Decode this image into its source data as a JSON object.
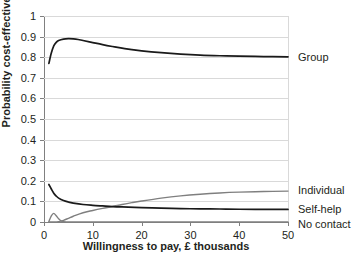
{
  "chart_data": {
    "type": "line",
    "title": "",
    "xlabel": "Willingness to pay, £ thousands",
    "ylabel": "Probability cost-effective",
    "xlim": [
      0,
      50
    ],
    "ylim": [
      0,
      1
    ],
    "xticks": [
      "0",
      "10",
      "20",
      "30",
      "40",
      "50"
    ],
    "yticks": [
      "0",
      "0.1",
      "0.2",
      "0.3",
      "0.4",
      "0.5",
      "0.6",
      "0.7",
      "0.8",
      "0.9",
      "1"
    ],
    "grid": "horizontal",
    "legend_position": "right-of-plot-at-series-end",
    "series": [
      {
        "name": "Group",
        "color": "#1a1a1a",
        "x": [
          1,
          1.5,
          2,
          2.5,
          3,
          4,
          5,
          6,
          7,
          8,
          10,
          12,
          14,
          16,
          18,
          20,
          24,
          28,
          32,
          36,
          40,
          45,
          50
        ],
        "values": [
          0.77,
          0.82,
          0.855,
          0.872,
          0.881,
          0.888,
          0.89,
          0.889,
          0.886,
          0.881,
          0.871,
          0.861,
          0.852,
          0.844,
          0.837,
          0.831,
          0.822,
          0.815,
          0.81,
          0.807,
          0.805,
          0.803,
          0.802
        ]
      },
      {
        "name": "Individual",
        "color": "#7f7f7f",
        "x": [
          1,
          2,
          3,
          4,
          5,
          6,
          8,
          10,
          12,
          14,
          16,
          18,
          20,
          24,
          28,
          32,
          36,
          40,
          45,
          50
        ],
        "values": [
          0.0,
          0.0,
          0.002,
          0.008,
          0.018,
          0.028,
          0.045,
          0.056,
          0.066,
          0.075,
          0.085,
          0.094,
          0.102,
          0.116,
          0.127,
          0.135,
          0.141,
          0.145,
          0.148,
          0.15
        ]
      },
      {
        "name": "Self-help",
        "color": "#1a1a1a",
        "x": [
          1,
          1.5,
          2,
          2.5,
          3,
          4,
          5,
          6,
          8,
          10,
          12,
          14,
          16,
          20,
          24,
          28,
          32,
          36,
          40,
          45,
          50
        ],
        "values": [
          0.182,
          0.16,
          0.14,
          0.126,
          0.116,
          0.104,
          0.097,
          0.092,
          0.085,
          0.081,
          0.078,
          0.075,
          0.073,
          0.07,
          0.067,
          0.065,
          0.064,
          0.063,
          0.062,
          0.061,
          0.061
        ]
      },
      {
        "name": "No contact",
        "color": "#7f7f7f",
        "x": [
          1,
          1.5,
          2,
          2.5,
          3,
          3.5,
          4,
          6,
          10,
          20,
          30,
          40,
          50
        ],
        "values": [
          0.002,
          0.03,
          0.042,
          0.03,
          0.016,
          0.006,
          0.001,
          0.0,
          0.0,
          0.0,
          0.0,
          0.0,
          0.0
        ]
      }
    ],
    "end_labels": [
      {
        "name": "Group",
        "y_value": 0.8
      },
      {
        "name": "Individual",
        "y_value": 0.15
      },
      {
        "name": "Self-help",
        "y_value": 0.062
      },
      {
        "name": "No contact",
        "y_value": 0.0
      }
    ]
  }
}
